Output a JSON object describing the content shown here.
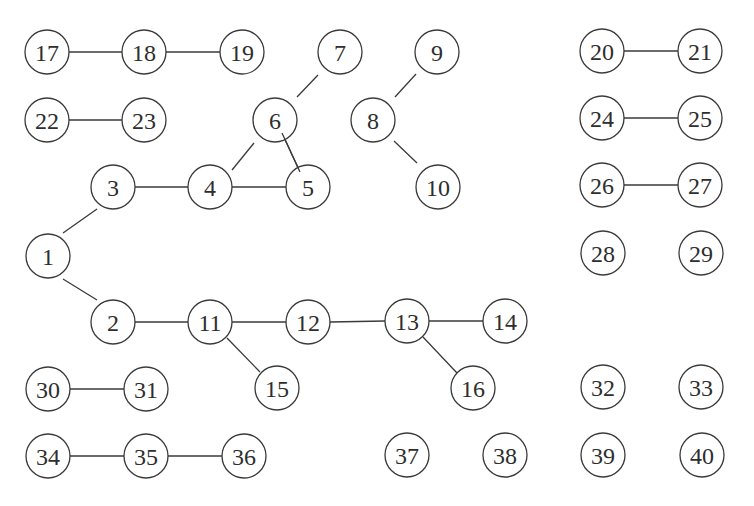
{
  "diagram": {
    "type": "undirected-graph",
    "style": {
      "stroke_color": "#3a3a3a",
      "text_color": "#2e2e2e",
      "background": "#ffffff",
      "node_radius": 22
    },
    "nodes": [
      {
        "id": "1",
        "label": "1",
        "x": 48,
        "y": 256
      },
      {
        "id": "2",
        "label": "2",
        "x": 113,
        "y": 322
      },
      {
        "id": "3",
        "label": "3",
        "x": 113,
        "y": 187
      },
      {
        "id": "4",
        "label": "4",
        "x": 210,
        "y": 187
      },
      {
        "id": "5",
        "label": "5",
        "x": 308,
        "y": 187
      },
      {
        "id": "6",
        "label": "6",
        "x": 275,
        "y": 120
      },
      {
        "id": "7",
        "label": "7",
        "x": 340,
        "y": 52
      },
      {
        "id": "8",
        "label": "8",
        "x": 373,
        "y": 120
      },
      {
        "id": "9",
        "label": "9",
        "x": 437,
        "y": 52
      },
      {
        "id": "10",
        "label": "10",
        "x": 438,
        "y": 187
      },
      {
        "id": "11",
        "label": "11",
        "x": 210,
        "y": 322
      },
      {
        "id": "12",
        "label": "12",
        "x": 308,
        "y": 322
      },
      {
        "id": "13",
        "label": "13",
        "x": 407,
        "y": 321
      },
      {
        "id": "14",
        "label": "14",
        "x": 505,
        "y": 321
      },
      {
        "id": "15",
        "label": "15",
        "x": 277,
        "y": 388
      },
      {
        "id": "16",
        "label": "16",
        "x": 473,
        "y": 388
      },
      {
        "id": "17",
        "label": "17",
        "x": 47,
        "y": 52
      },
      {
        "id": "18",
        "label": "18",
        "x": 144,
        "y": 52
      },
      {
        "id": "19",
        "label": "19",
        "x": 242,
        "y": 52
      },
      {
        "id": "20",
        "label": "20",
        "x": 602,
        "y": 51
      },
      {
        "id": "21",
        "label": "21",
        "x": 700,
        "y": 51
      },
      {
        "id": "22",
        "label": "22",
        "x": 47,
        "y": 120
      },
      {
        "id": "23",
        "label": "23",
        "x": 144,
        "y": 120
      },
      {
        "id": "24",
        "label": "24",
        "x": 602,
        "y": 118
      },
      {
        "id": "25",
        "label": "25",
        "x": 700,
        "y": 118
      },
      {
        "id": "26",
        "label": "26",
        "x": 602,
        "y": 185
      },
      {
        "id": "27",
        "label": "27",
        "x": 700,
        "y": 185
      },
      {
        "id": "28",
        "label": "28",
        "x": 603,
        "y": 253
      },
      {
        "id": "29",
        "label": "29",
        "x": 701,
        "y": 253
      },
      {
        "id": "30",
        "label": "30",
        "x": 48,
        "y": 389
      },
      {
        "id": "31",
        "label": "31",
        "x": 146,
        "y": 389
      },
      {
        "id": "32",
        "label": "32",
        "x": 603,
        "y": 387
      },
      {
        "id": "33",
        "label": "33",
        "x": 701,
        "y": 387
      },
      {
        "id": "34",
        "label": "34",
        "x": 48,
        "y": 456
      },
      {
        "id": "35",
        "label": "35",
        "x": 146,
        "y": 456
      },
      {
        "id": "36",
        "label": "36",
        "x": 244,
        "y": 456
      },
      {
        "id": "37",
        "label": "37",
        "x": 407,
        "y": 455
      },
      {
        "id": "38",
        "label": "38",
        "x": 505,
        "y": 455
      },
      {
        "id": "39",
        "label": "39",
        "x": 603,
        "y": 455
      },
      {
        "id": "40",
        "label": "40",
        "x": 702,
        "y": 455
      }
    ],
    "edges": [
      {
        "from": "1",
        "to": "3",
        "x1": 63,
        "y1": 233,
        "x2": 97,
        "y2": 209
      },
      {
        "from": "1",
        "to": "2",
        "x1": 63,
        "y1": 279,
        "x2": 97,
        "y2": 300
      },
      {
        "from": "3",
        "to": "4",
        "x1": 135,
        "y1": 187,
        "x2": 188,
        "y2": 187
      },
      {
        "from": "4",
        "to": "5",
        "x1": 232,
        "y1": 187,
        "x2": 286,
        "y2": 187
      },
      {
        "from": "4",
        "to": "6",
        "x1": 232,
        "y1": 170,
        "x2": 254,
        "y2": 143
      },
      {
        "from": "6",
        "to": "5",
        "x1": 282,
        "y1": 133,
        "x2": 300,
        "y2": 172
      },
      {
        "from": "6",
        "to": "7",
        "x1": 297,
        "y1": 97,
        "x2": 318,
        "y2": 75
      },
      {
        "from": "8",
        "to": "9",
        "x1": 395,
        "y1": 97,
        "x2": 416,
        "y2": 74
      },
      {
        "from": "8",
        "to": "10",
        "x1": 394,
        "y1": 141,
        "x2": 417,
        "y2": 163
      },
      {
        "from": "2",
        "to": "11",
        "x1": 135,
        "y1": 322,
        "x2": 188,
        "y2": 322
      },
      {
        "from": "11",
        "to": "12",
        "x1": 232,
        "y1": 322,
        "x2": 286,
        "y2": 322
      },
      {
        "from": "12",
        "to": "13",
        "x1": 330,
        "y1": 322,
        "x2": 385,
        "y2": 321
      },
      {
        "from": "13",
        "to": "14",
        "x1": 429,
        "y1": 321,
        "x2": 483,
        "y2": 321
      },
      {
        "from": "11",
        "to": "15",
        "x1": 227,
        "y1": 338,
        "x2": 260,
        "y2": 372
      },
      {
        "from": "13",
        "to": "16",
        "x1": 423,
        "y1": 337,
        "x2": 457,
        "y2": 373
      },
      {
        "from": "17",
        "to": "18",
        "x1": 69,
        "y1": 52,
        "x2": 122,
        "y2": 52
      },
      {
        "from": "18",
        "to": "19",
        "x1": 166,
        "y1": 52,
        "x2": 220,
        "y2": 52
      },
      {
        "from": "22",
        "to": "23",
        "x1": 69,
        "y1": 120,
        "x2": 122,
        "y2": 120
      },
      {
        "from": "20",
        "to": "21",
        "x1": 624,
        "y1": 51,
        "x2": 678,
        "y2": 51
      },
      {
        "from": "24",
        "to": "25",
        "x1": 624,
        "y1": 118,
        "x2": 678,
        "y2": 118
      },
      {
        "from": "26",
        "to": "27",
        "x1": 624,
        "y1": 185,
        "x2": 678,
        "y2": 185
      },
      {
        "from": "30",
        "to": "31",
        "x1": 70,
        "y1": 389,
        "x2": 124,
        "y2": 389
      },
      {
        "from": "34",
        "to": "35",
        "x1": 70,
        "y1": 456,
        "x2": 124,
        "y2": 456
      },
      {
        "from": "35",
        "to": "36",
        "x1": 168,
        "y1": 456,
        "x2": 222,
        "y2": 456
      }
    ]
  }
}
